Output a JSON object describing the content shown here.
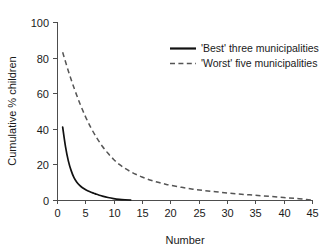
{
  "chart_data": {
    "type": "line",
    "title": "",
    "xlabel": "Number",
    "ylabel": "Cumulative % children",
    "xlim": [
      0,
      45
    ],
    "ylim": [
      0,
      100
    ],
    "xticks": [
      0,
      5,
      10,
      15,
      20,
      25,
      30,
      35,
      40,
      45
    ],
    "yticks": [
      0,
      20,
      40,
      60,
      80,
      100
    ],
    "xtick_labels": [
      "0",
      "5",
      "10",
      "15",
      "20",
      "25",
      "30",
      "35",
      "40",
      "45"
    ],
    "ytick_labels": [
      "0",
      "20",
      "40",
      "60",
      "80",
      "100"
    ],
    "grid": false,
    "legend_position": "upper right",
    "series": [
      {
        "name": "'Best' three municipalities",
        "style": "solid",
        "color": "#111111",
        "x": [
          1,
          1.5,
          2,
          2.5,
          3,
          3.5,
          4,
          4.5,
          5,
          5.5,
          6,
          6.5,
          7,
          7.5,
          8,
          9,
          10,
          11,
          12,
          13
        ],
        "values": [
          41,
          30,
          22,
          16.5,
          12.6,
          10.0,
          8.2,
          6.9,
          5.9,
          5.1,
          4.4,
          3.8,
          3.2,
          2.7,
          2.2,
          1.4,
          0.8,
          0.4,
          0.15,
          0
        ]
      },
      {
        "name": "'Worst' five municipalities",
        "style": "dashed",
        "color": "#555555",
        "x": [
          1,
          2,
          3,
          4,
          5,
          6,
          7,
          8,
          9,
          10,
          11,
          12,
          13,
          14,
          15,
          16,
          17,
          18,
          19,
          20,
          22,
          24,
          26,
          28,
          30,
          32,
          34,
          36,
          38,
          40,
          42,
          44,
          45
        ],
        "values": [
          83,
          72.5,
          63,
          54.5,
          47,
          40.5,
          35,
          30.2,
          26.2,
          22.8,
          20.0,
          17.8,
          15.9,
          14.3,
          12.9,
          11.7,
          10.7,
          9.8,
          9.0,
          8.3,
          7.1,
          6.1,
          5.3,
          4.6,
          4.0,
          3.4,
          2.9,
          2.4,
          1.9,
          1.4,
          0.9,
          0.3,
          0
        ]
      }
    ]
  },
  "legend": {
    "entries": [
      {
        "label": "'Best' three municipalities",
        "style": "solid"
      },
      {
        "label": "'Worst' five municipalities",
        "style": "dashed"
      }
    ]
  }
}
